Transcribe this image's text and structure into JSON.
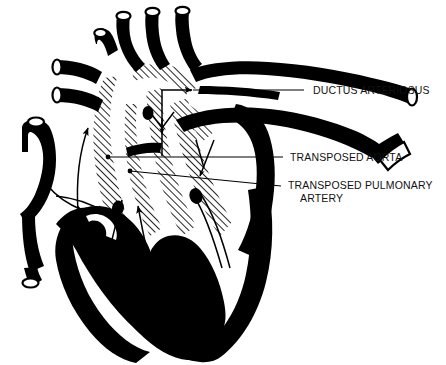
{
  "figure": {
    "type": "anatomical-diagram",
    "background_color": "#ffffff",
    "ink_color": "#000000",
    "hatch_color": "#000000"
  },
  "labels": [
    {
      "id": "ductus-arteriosus",
      "text": "DUCTUS ARTERIOSUS",
      "text_x": 313,
      "text_y": 94,
      "leader": {
        "x1": 304,
        "y1": 90,
        "x2": 193,
        "y2": 90
      }
    },
    {
      "id": "transposed-aorta",
      "text": "TRANSPOSED AORTA",
      "text_x": 290,
      "text_y": 161,
      "leader": {
        "x1": 283,
        "y1": 157,
        "x2": 108,
        "y2": 157
      }
    },
    {
      "id": "transposed-pulmonary-artery",
      "text": "TRANSPOSED PULMONARY",
      "text_line2": "ARTERY",
      "text_x": 288,
      "text_y": 189,
      "text2_x": 300,
      "text2_y": 202,
      "leader": {
        "x1": 281,
        "y1": 186,
        "x2": 130,
        "y2": 171
      }
    }
  ],
  "flow_arrows": [
    {
      "id": "arrow-left-atrium-upper",
      "description": "curved arrow in left atrium"
    },
    {
      "id": "arrow-left-atrium-lower",
      "description": "curved arrow into left ventricle"
    },
    {
      "id": "arrow-left-ventricle-up",
      "description": "upward arrow in left ventricle"
    },
    {
      "id": "arrow-septum-up",
      "description": "upward arrow along septum"
    },
    {
      "id": "arrow-right-ventricle-up",
      "description": "upward arrow in right ventricle"
    },
    {
      "id": "arrow-outflow-up-right",
      "description": "vertical then rightward arrow at outflow"
    },
    {
      "id": "arrow-outflow-down",
      "description": "downward arrowhead at outflow tract"
    },
    {
      "id": "arrow-aortic-arch",
      "description": "arrow along aortic arch"
    }
  ],
  "structures": [
    {
      "id": "aorta-transposed",
      "fill": "solid-black"
    },
    {
      "id": "pulmonary-artery-transposed",
      "fill": "solid-black"
    },
    {
      "id": "ductus-arteriosus-vessel",
      "fill": "solid-black"
    },
    {
      "id": "brachiocephalic-vessels",
      "fill": "solid-black"
    },
    {
      "id": "superior-vena-cava",
      "fill": "solid-black"
    },
    {
      "id": "inferior-vena-cava",
      "fill": "solid-black"
    },
    {
      "id": "pulmonary-veins",
      "fill": "solid-black"
    },
    {
      "id": "myocardium-wall",
      "fill": "solid-black"
    },
    {
      "id": "interventricular-septum",
      "fill": "hatched"
    },
    {
      "id": "atrial-septum",
      "fill": "hatched"
    }
  ]
}
